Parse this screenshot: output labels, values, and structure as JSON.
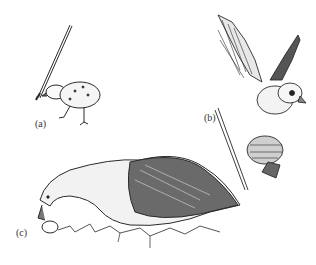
{
  "figure": {
    "panels": [
      {
        "label": "(a)",
        "subject": "chick pecking at stick"
      },
      {
        "label": "(b)",
        "subject": "bird with spread wings perched on stick with cone"
      },
      {
        "label": "(c)",
        "subject": "goose rolling egg in grass"
      }
    ],
    "colors": {
      "ink": "#2a2a2a",
      "paper": "#ffffff"
    }
  }
}
